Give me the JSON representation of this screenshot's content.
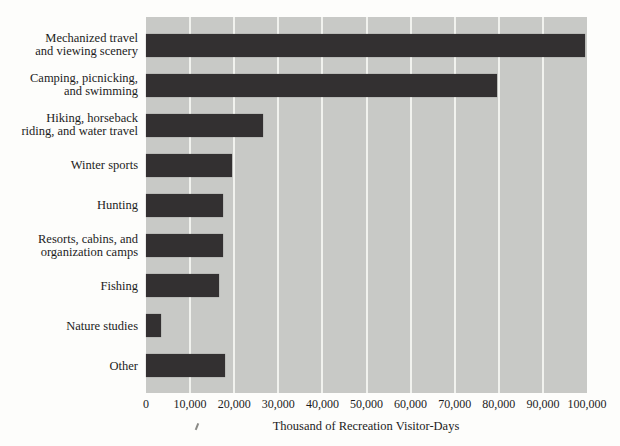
{
  "colors": {
    "page_background": "#fdfdfb",
    "plot_background": "#c8c9c6",
    "bar": "#333031",
    "gridline": "#f1f2ee",
    "text": "#1c1c1c"
  },
  "chart_data": {
    "type": "bar",
    "orientation": "horizontal",
    "title": "",
    "xlabel": "Thousand of Recreation Visitor-Days",
    "ylabel": "",
    "xlim": [
      0,
      100000
    ],
    "grid": "vertical-white-lines-every-10000",
    "legend": "none",
    "x_tick_values": [
      0,
      10000,
      20000,
      30000,
      40000,
      50000,
      60000,
      70000,
      80000,
      90000,
      100000
    ],
    "x_tick_labels": [
      "0",
      "10,000",
      "20,000",
      "30,000",
      "40,000",
      "50,000",
      "60,000",
      "70,000",
      "80,000",
      "90,000",
      "100,000"
    ],
    "categories": [
      "Mechanized travel and viewing scenery",
      "Camping, picnicking, and swimming",
      "Hiking, horseback riding, and water travel",
      "Winter sports",
      "Hunting",
      "Resorts, cabins, and organization camps",
      "Fishing",
      "Nature studies",
      "Other"
    ],
    "category_label_lines": [
      [
        "Mechanized travel",
        "and viewing scenery"
      ],
      [
        "Camping, picnicking,",
        "and swimming"
      ],
      [
        "Hiking, horseback",
        "riding, and water travel"
      ],
      [
        "Winter sports"
      ],
      [
        "Hunting"
      ],
      [
        "Resorts, cabins, and",
        "organization camps"
      ],
      [
        "Fishing"
      ],
      [
        "Nature studies"
      ],
      [
        "Other"
      ]
    ],
    "values": [
      99500,
      79500,
      26500,
      19500,
      17500,
      17500,
      16500,
      3300,
      17800
    ]
  }
}
